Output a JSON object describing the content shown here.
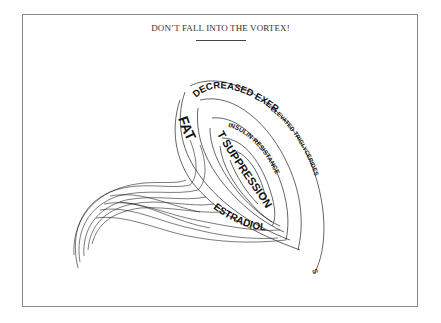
{
  "title": "DON’T FALL INTO THE VORTEX!",
  "colors": {
    "ink": "#111111",
    "border": "#8a8a8a",
    "background": "#ffffff"
  },
  "vortex": {
    "labels": {
      "decreased_exercise": "DECREASED EXERCISE",
      "elevated_triglycerides": "ELEVATED TRIGLYCERIDES",
      "insulin_resistance": "INSULIN-RESISTANCE",
      "fat": "FAT",
      "t_suppression": "T SUPPRESSION",
      "estradiol": "ESTRADIOL",
      "trailing_s": "S"
    }
  }
}
